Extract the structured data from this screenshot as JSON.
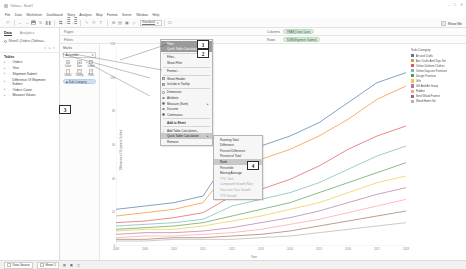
{
  "window": {
    "title": "Tableau - Book1",
    "controls": [
      "–",
      "□",
      "✕"
    ]
  },
  "menubar": [
    "File",
    "Data",
    "Worksheet",
    "Dashboard",
    "Story",
    "Analysis",
    "Map",
    "Format",
    "Server",
    "Window",
    "Help"
  ],
  "toolbar": {
    "icons": [
      "tableau-home-icon",
      "undo-icon",
      "redo-icon",
      "save-icon",
      "refresh-icon",
      "pause-icon",
      "swap-axes-icon",
      "sort-asc-icon",
      "sort-desc-icon",
      "highlight-icon",
      "group-icon",
      "labels-icon",
      "fit-icon",
      "format-icon",
      "show-cards-icon",
      "presentation-icon"
    ],
    "fit_label": "Standard",
    "show_me_label": "Show Me"
  },
  "data_pane": {
    "tabs": [
      {
        "label": "Data",
        "active": true
      },
      {
        "label": "Analytics",
        "active": false
      }
    ],
    "datasource": "Sheet1 (Orders (Tableau...",
    "search_placeholder": "",
    "section_title": "Tables",
    "tables": [
      {
        "label": "Orders"
      },
      {
        "label": "Year"
      },
      {
        "label": "Shipment Submit"
      },
      {
        "label": "Difference Of Shipment Submit"
      },
      {
        "label": "Orders Count"
      },
      {
        "label": "Measure Values"
      }
    ]
  },
  "shelves": {
    "pages_label": "Pages",
    "filters_label": "Filters",
    "columns_label": "Columns",
    "rows_label": "Rows",
    "columns_pills": [
      "YEAR(Order Date)"
    ],
    "rows_pills": [
      "SUM(Shipment Submit)"
    ],
    "sheet_tab_label": "Sheet 1"
  },
  "marks": {
    "title": "Marks",
    "type": "Automatic",
    "buttons": [
      {
        "label": "Color",
        "icon": "color-icon"
      },
      {
        "label": "Size",
        "icon": "size-icon"
      },
      {
        "label": "Label",
        "icon": "label-icon"
      },
      {
        "label": "Detail",
        "icon": "detail-icon"
      },
      {
        "label": "Tooltip",
        "icon": "tooltip-icon"
      },
      {
        "label": "Path",
        "icon": "path-icon"
      }
    ],
    "pill": "Sub-Category"
  },
  "context_menu": {
    "items": [
      {
        "label": "Filter",
        "state": "selected",
        "kind": "plain"
      },
      {
        "label": "Quick Table Calculation",
        "state": "selected",
        "kind": "plain"
      },
      {
        "label": "Filter...",
        "state": "normal",
        "kind": "plain"
      },
      {
        "label": "Show Filter",
        "state": "normal",
        "kind": "plain"
      },
      {
        "label": "Format...",
        "state": "normal",
        "kind": "plain"
      },
      {
        "label": "Show Header",
        "state": "normal",
        "kind": "check",
        "checked": true
      },
      {
        "label": "Include in Tooltip",
        "state": "normal",
        "kind": "check",
        "checked": true
      },
      {
        "label": "Dimension",
        "state": "normal",
        "kind": "radio",
        "checked": false
      },
      {
        "label": "Attribute",
        "state": "normal",
        "kind": "radio",
        "checked": false
      },
      {
        "label": "Measure (Sum)",
        "state": "normal",
        "kind": "radio",
        "checked": true,
        "submenu": true
      },
      {
        "label": "Discrete",
        "state": "normal",
        "kind": "radio",
        "checked": false
      },
      {
        "label": "Continuous",
        "state": "normal",
        "kind": "radio",
        "checked": true
      },
      {
        "label": "Add to Sheet",
        "state": "normal",
        "kind": "bold"
      },
      {
        "label": "Add Table Calculation...",
        "state": "normal",
        "kind": "plain"
      },
      {
        "label": "Quick Table Calculation",
        "state": "highlight",
        "kind": "plain",
        "submenu": true
      },
      {
        "label": "Remove",
        "state": "normal",
        "kind": "plain"
      }
    ]
  },
  "submenu": {
    "items": [
      {
        "label": "Running Total",
        "state": "normal"
      },
      {
        "label": "Difference",
        "state": "normal"
      },
      {
        "label": "Percent Difference",
        "state": "normal"
      },
      {
        "label": "Percent of Total",
        "state": "normal"
      },
      {
        "label": "Rank",
        "state": "highlight"
      },
      {
        "label": "Percentile",
        "state": "normal"
      },
      {
        "label": "Moving Average",
        "state": "normal"
      },
      {
        "label": "YTD Total",
        "state": "disabled"
      },
      {
        "label": "Compound Growth Rate",
        "state": "disabled"
      },
      {
        "label": "Year over Year Growth",
        "state": "disabled"
      },
      {
        "label": "YTD Growth",
        "state": "disabled"
      }
    ]
  },
  "markers": [
    {
      "id": "1",
      "label": "1"
    },
    {
      "id": "2",
      "label": "2"
    },
    {
      "id": "3",
      "label": "3"
    },
    {
      "id": "4",
      "label": "4"
    }
  ],
  "legend": {
    "title": "Sub-Category",
    "items": [
      {
        "label": "Art and Crafts",
        "color": "#4e79a7"
      },
      {
        "label": "Arts Crafts And Toys Set",
        "color": "#f28e2b"
      },
      {
        "label": "Online Uniform Clothes",
        "color": "#e15759"
      },
      {
        "label": "Online Daycare Furniture",
        "color": "#76b7b2"
      },
      {
        "label": "Design Furniture",
        "color": "#59a14f"
      },
      {
        "label": "Gifts",
        "color": "#edc948"
      },
      {
        "label": "Gift And Art Group",
        "color": "#b07aa1"
      },
      {
        "label": "Rubber",
        "color": "#ff9da7"
      },
      {
        "label": "Steel Wood Frames",
        "color": "#9c755f"
      },
      {
        "label": "Wood Home Set",
        "color": "#bab0ac"
      }
    ]
  },
  "statusbar": {
    "left_label": "Data Source",
    "sheet_tabs": [
      "Sheet 1"
    ],
    "actions": [
      "new-worksheet-icon",
      "new-dashboard-icon",
      "new-story-icon"
    ]
  },
  "chart_data": {
    "type": "line",
    "title": "",
    "xlabel": "Year",
    "ylabel": "Difference of Shipment Submit",
    "grid": false,
    "legend_position": "right",
    "x": [
      "2008",
      "2009",
      "2010",
      "2011",
      "2012",
      "2013",
      "2014",
      "2015",
      "2016",
      "2017",
      "2018"
    ],
    "ylim": [
      0,
      120
    ],
    "yticks": [
      0,
      20,
      40,
      60,
      80,
      100,
      120
    ],
    "series": [
      {
        "name": "Art and Crafts",
        "color": "#4e79a7",
        "values": [
          22,
          24,
          26,
          30,
          56,
          60,
          66,
          74,
          86,
          98,
          104
        ]
      },
      {
        "name": "Arts Crafts And Toys Set",
        "color": "#f28e2b",
        "values": [
          18,
          20,
          22,
          26,
          48,
          52,
          58,
          66,
          76,
          88,
          96
        ]
      },
      {
        "name": "Online Uniform Clothes",
        "color": "#e15759",
        "values": [
          14,
          15,
          17,
          20,
          30,
          34,
          40,
          48,
          58,
          66,
          72
        ]
      },
      {
        "name": "Online Daycare Furniture",
        "color": "#76b7b2",
        "values": [
          12,
          13,
          14,
          16,
          24,
          28,
          32,
          38,
          46,
          54,
          60
        ]
      },
      {
        "name": "Design Furniture",
        "color": "#59a14f",
        "values": [
          10,
          11,
          12,
          14,
          18,
          22,
          26,
          32,
          38,
          44,
          50
        ]
      },
      {
        "name": "Gifts",
        "color": "#edc948",
        "values": [
          9,
          10,
          10,
          12,
          15,
          18,
          22,
          26,
          32,
          38,
          42
        ]
      },
      {
        "name": "Gift And Art Group",
        "color": "#b07aa1",
        "values": [
          7,
          8,
          8,
          9,
          11,
          14,
          17,
          21,
          26,
          31,
          35
        ]
      },
      {
        "name": "Rubber",
        "color": "#ff9da7",
        "values": [
          5,
          6,
          6,
          7,
          8,
          10,
          13,
          16,
          20,
          24,
          28
        ]
      },
      {
        "name": "Steel Wood Frames",
        "color": "#9c755f",
        "values": [
          4,
          4,
          5,
          5,
          6,
          7,
          9,
          12,
          15,
          18,
          21
        ]
      },
      {
        "name": "Wood Home Set",
        "color": "#bab0ac",
        "values": [
          3,
          3,
          4,
          4,
          4,
          5,
          6,
          8,
          10,
          12,
          14
        ]
      }
    ]
  }
}
